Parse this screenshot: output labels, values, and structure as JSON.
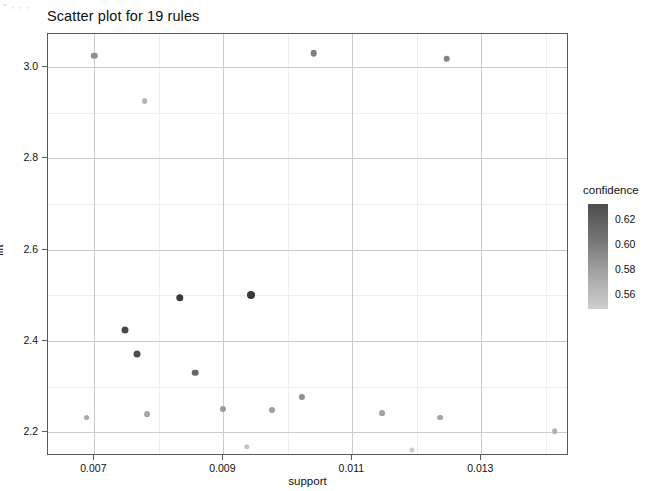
{
  "chart_data": {
    "type": "scatter",
    "title": "Scatter plot for 19 rules",
    "xlabel": "support",
    "ylabel": "lift",
    "xlim": [
      0.00628,
      0.01436
    ],
    "ylim": [
      2.148,
      3.072
    ],
    "xticks": [
      0.007,
      0.009,
      0.011,
      0.013
    ],
    "xtick_labels": [
      "0.007",
      "0.009",
      "0.011",
      "0.013"
    ],
    "yticks": [
      2.2,
      2.4,
      2.6,
      2.8,
      3.0
    ],
    "ytick_labels": [
      "2.2",
      "2.4",
      "2.6",
      "2.8",
      "3.0"
    ],
    "grid": true,
    "legend": {
      "title": "confidence",
      "position": "right",
      "type": "colorbar",
      "ticks": [
        0.62,
        0.6,
        0.58,
        0.56
      ],
      "tick_labels": [
        "0.62",
        "0.60",
        "0.58",
        "0.56"
      ],
      "vmin": 0.548,
      "vmax": 0.632,
      "color_high": "#4d4d4d",
      "color_low": "#d4d4d4"
    },
    "n_rules": 19,
    "points": [
      {
        "support": 0.007,
        "lift": 3.025,
        "confidence": 0.588,
        "color": "#8e8e8e",
        "r": 3.2
      },
      {
        "support": 0.00778,
        "lift": 2.925,
        "confidence": 0.566,
        "color": "#b5b5b5",
        "r": 2.9
      },
      {
        "support": 0.0104,
        "lift": 3.03,
        "confidence": 0.596,
        "color": "#808080",
        "r": 3.3
      },
      {
        "support": 0.01246,
        "lift": 3.018,
        "confidence": 0.594,
        "color": "#838383",
        "r": 3.3
      },
      {
        "support": 0.00832,
        "lift": 2.495,
        "confidence": 0.628,
        "color": "#3b3b3b",
        "r": 3.7
      },
      {
        "support": 0.00942,
        "lift": 2.5,
        "confidence": 0.63,
        "color": "#393939",
        "r": 4.0
      },
      {
        "support": 0.00748,
        "lift": 2.425,
        "confidence": 0.62,
        "color": "#474747",
        "r": 3.5
      },
      {
        "support": 0.00766,
        "lift": 2.372,
        "confidence": 0.616,
        "color": "#4d4d4d",
        "r": 3.5
      },
      {
        "support": 0.00856,
        "lift": 2.33,
        "confidence": 0.606,
        "color": "#666666",
        "r": 3.3
      },
      {
        "support": 0.009,
        "lift": 2.25,
        "confidence": 0.58,
        "color": "#9b9b9b",
        "r": 3.0
      },
      {
        "support": 0.00976,
        "lift": 2.248,
        "confidence": 0.578,
        "color": "#9e9e9e",
        "r": 3.0
      },
      {
        "support": 0.01022,
        "lift": 2.278,
        "confidence": 0.586,
        "color": "#8f8f8f",
        "r": 3.1
      },
      {
        "support": 0.00688,
        "lift": 2.232,
        "confidence": 0.572,
        "color": "#a8a8a8",
        "r": 2.9
      },
      {
        "support": 0.00782,
        "lift": 2.24,
        "confidence": 0.574,
        "color": "#a5a5a5",
        "r": 2.9
      },
      {
        "support": 0.01146,
        "lift": 2.242,
        "confidence": 0.576,
        "color": "#a2a2a2",
        "r": 2.9
      },
      {
        "support": 0.01236,
        "lift": 2.232,
        "confidence": 0.573,
        "color": "#a6a6a6",
        "r": 2.9
      },
      {
        "support": 0.01414,
        "lift": 2.202,
        "confidence": 0.566,
        "color": "#b0b0b0",
        "r": 2.8
      },
      {
        "support": 0.00936,
        "lift": 2.168,
        "confidence": 0.556,
        "color": "#c6c6c6",
        "r": 2.7
      },
      {
        "support": 0.01192,
        "lift": 2.162,
        "confidence": 0.553,
        "color": "#cbcbcb",
        "r": 2.6
      }
    ]
  },
  "artifact": {
    "top_left_speckle": "~ , , ,"
  }
}
